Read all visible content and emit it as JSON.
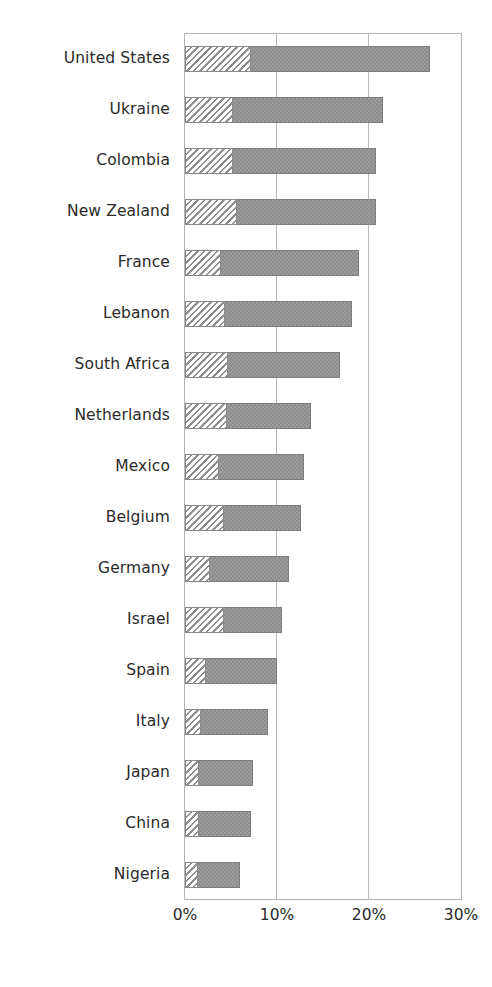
{
  "chart_data": {
    "type": "bar",
    "orientation": "horizontal",
    "stacked": true,
    "title": "",
    "xlabel": "",
    "ylabel": "",
    "xlim": [
      0,
      30
    ],
    "xticks": [
      0,
      10,
      20,
      30
    ],
    "xtick_labels": [
      "0%",
      "10%",
      "20%",
      "30%"
    ],
    "grid": true,
    "gridlines_at": [
      10,
      20
    ],
    "legend": "none",
    "categories": [
      "United States",
      "Ukraine",
      "Colombia",
      "New Zealand",
      "France",
      "Lebanon",
      "South Africa",
      "Netherlands",
      "Mexico",
      "Belgium",
      "Germany",
      "Israel",
      "Spain",
      "Italy",
      "Japan",
      "China",
      "Nigeria"
    ],
    "series": [
      {
        "name": "hatched-segment",
        "pattern": "diagonal-hatch",
        "color": "#ffffff",
        "values": [
          7.2,
          5.2,
          5.2,
          5.7,
          3.9,
          4.4,
          4.7,
          4.6,
          3.7,
          4.2,
          2.7,
          4.2,
          2.3,
          1.7,
          1.5,
          1.5,
          1.4
        ]
      },
      {
        "name": "total-bar",
        "pattern": "solid-textured",
        "color": "#8c8c8c",
        "values": [
          26.6,
          21.5,
          20.8,
          20.8,
          18.9,
          18.1,
          16.9,
          13.7,
          12.9,
          12.6,
          11.3,
          10.5,
          10.0,
          9.0,
          7.4,
          7.2,
          6.0
        ]
      }
    ],
    "colors": {
      "bar_fill": "#8c8c8c",
      "bar_edge": "#7d7d7d",
      "hatch_fill": "#ffffff",
      "hatch_line": "#8f8f8f",
      "frame": "#b3b3b3",
      "gridline": "#b9b9b9",
      "text": "#2b2b2b",
      "background": "#ffffff"
    }
  }
}
